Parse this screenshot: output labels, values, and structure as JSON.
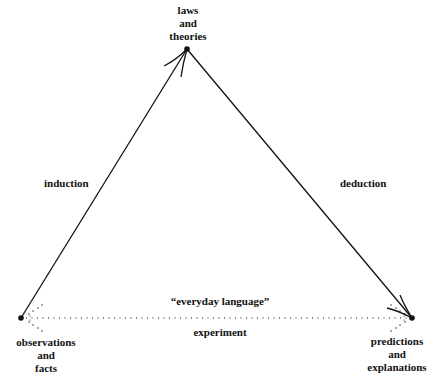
{
  "diagram": {
    "nodes": {
      "top": {
        "lines": [
          "laws",
          "and",
          "theories"
        ]
      },
      "left": {
        "lines": [
          "observations",
          "and",
          "facts"
        ]
      },
      "right": {
        "lines": [
          "predictions",
          "and",
          "explanations"
        ]
      }
    },
    "edges": {
      "left_edge": {
        "label": "induction",
        "from": "observations and facts",
        "to": "laws and theories",
        "style": "solid-arrow"
      },
      "right_edge": {
        "label": "deduction",
        "from": "laws and theories",
        "to": "predictions and explanations",
        "style": "solid-arrow"
      },
      "bottom_edge": {
        "label_above": "“everyday language”",
        "label_below": "experiment",
        "style": "dotted"
      }
    },
    "colors": {
      "ink": "#111111",
      "background": "#ffffff"
    }
  }
}
